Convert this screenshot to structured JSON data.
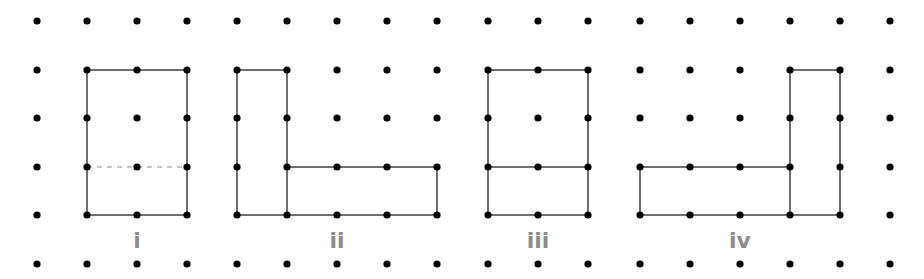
{
  "diagram": {
    "grid": {
      "columns_x": [
        37,
        87,
        137,
        187,
        237,
        287,
        337,
        387,
        437,
        488,
        538,
        588,
        640,
        690,
        740,
        790,
        840,
        890
      ],
      "rows_y": [
        21,
        70,
        118,
        167,
        215,
        264
      ],
      "dot_radius": 3.6,
      "dot_color": "#000000"
    },
    "line_color": "#6e6e6e",
    "label_color": "#8c8c8c",
    "figures": [
      {
        "label": "i",
        "label_pos": [
          137,
          248
        ],
        "outline": [
          [
            1,
            1
          ],
          [
            3,
            1
          ],
          [
            3,
            4
          ],
          [
            1,
            4
          ]
        ],
        "inner_lines": [
          {
            "from": [
              1,
              3
            ],
            "to": [
              3,
              3
            ],
            "style": "dashed"
          }
        ]
      },
      {
        "label": "ii",
        "label_pos": [
          337,
          248
        ],
        "outline": [
          [
            4,
            1
          ],
          [
            5,
            1
          ],
          [
            5,
            3
          ],
          [
            8,
            3
          ],
          [
            8,
            4
          ],
          [
            4,
            4
          ]
        ],
        "inner_lines": [
          {
            "from": [
              5,
              3
            ],
            "to": [
              5,
              4
            ],
            "style": "solid"
          }
        ]
      },
      {
        "label": "iii",
        "label_pos": [
          538,
          248
        ],
        "outline": [
          [
            9,
            1
          ],
          [
            11,
            1
          ],
          [
            11,
            4
          ],
          [
            9,
            4
          ]
        ],
        "inner_lines": [
          {
            "from": [
              9,
              3
            ],
            "to": [
              11,
              3
            ],
            "style": "solid"
          }
        ]
      },
      {
        "label": "iv",
        "label_pos": [
          740,
          248
        ],
        "outline": [
          [
            12,
            3
          ],
          [
            15,
            3
          ],
          [
            15,
            1
          ],
          [
            16,
            1
          ],
          [
            16,
            4
          ],
          [
            12,
            4
          ]
        ],
        "inner_lines": [
          {
            "from": [
              15,
              3
            ],
            "to": [
              15,
              4
            ],
            "style": "solid"
          }
        ]
      }
    ]
  }
}
